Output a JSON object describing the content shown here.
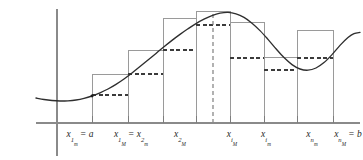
{
  "figure": {
    "axis": {
      "x_axis_name": "x-axis",
      "y_axis_name": "y-axis",
      "origin_x": 57,
      "baseline_y": 123
    },
    "labels": [
      {
        "id": "label-x1m",
        "x": 80,
        "text": "x1m = a",
        "var": "x",
        "sub": "1",
        "subsub": "m",
        "suffix": "= a"
      },
      {
        "id": "label-x1M",
        "x": 131,
        "text": "x1M = x2m",
        "var": "x",
        "sub": "1",
        "subsub": "M",
        "suffix": "= x2m"
      },
      {
        "id": "label-x2M",
        "x": 180,
        "text": "x2M",
        "var": "x",
        "sub": "2",
        "subsub": "M",
        "suffix": ""
      },
      {
        "id": "label-xiM",
        "x": 232,
        "text": "xiM",
        "var": "x",
        "sub": "i",
        "subsub": "M",
        "suffix": ""
      },
      {
        "id": "label-xim",
        "x": 266,
        "text": "xim",
        "var": "x",
        "sub": "i",
        "subsub": "m",
        "suffix": ""
      },
      {
        "id": "label-xnm",
        "x": 312,
        "text": "xnm",
        "var": "x",
        "sub": "n",
        "subsub": "m",
        "suffix": ""
      },
      {
        "id": "label-xnM",
        "x": 348,
        "text": "xnM = b",
        "var": "x",
        "sub": "n",
        "subsub": "M",
        "suffix": "= b"
      }
    ],
    "equals_sign": "=",
    "endpoint_a": "a",
    "endpoint_b": "b",
    "second_subscript_m": "m",
    "second_subscript_M": "M"
  },
  "chart_data": {
    "type": "area",
    "xlabel": "",
    "ylabel": "",
    "grid": false,
    "legend": "none",
    "xlim": [
      36,
      363
    ],
    "ylim": [
      0,
      123
    ],
    "axis_origin_px": {
      "x": 57,
      "y": 123
    },
    "tick_positions_px": [
      92,
      128,
      163,
      196,
      230,
      264,
      297,
      333
    ],
    "peak_dashed_line_px": 213,
    "partition_edges_px": [
      92,
      128,
      163,
      196,
      213,
      230,
      264,
      297,
      333
    ],
    "upper_sum_rectangles": [
      {
        "name": "rect-1",
        "x0": 92,
        "x1": 128,
        "top_y": 74
      },
      {
        "name": "rect-2",
        "x0": 128,
        "x1": 163,
        "top_y": 50
      },
      {
        "name": "rect-3",
        "x0": 163,
        "x1": 196,
        "top_y": 18
      },
      {
        "name": "rect-4",
        "x0": 196,
        "x1": 230,
        "top_y": 11
      },
      {
        "name": "rect-5",
        "x0": 230,
        "x1": 264,
        "top_y": 22
      },
      {
        "name": "rect-6",
        "x0": 264,
        "x1": 297,
        "top_y": 57
      },
      {
        "name": "rect-7",
        "x0": 297,
        "x1": 333,
        "top_y": 30
      }
    ],
    "lower_sum_levels": [
      {
        "name": "lower-1",
        "x0": 92,
        "x1": 128,
        "top_y": 95
      },
      {
        "name": "lower-2",
        "x0": 128,
        "x1": 163,
        "top_y": 74
      },
      {
        "name": "lower-3",
        "x0": 163,
        "x1": 196,
        "top_y": 50
      },
      {
        "name": "lower-4",
        "x0": 196,
        "x1": 230,
        "top_y": 25
      },
      {
        "name": "lower-5",
        "x0": 230,
        "x1": 264,
        "top_y": 58
      },
      {
        "name": "lower-6",
        "x0": 264,
        "x1": 297,
        "top_y": 70
      },
      {
        "name": "lower-7",
        "x0": 297,
        "x1": 333,
        "top_y": 58
      }
    ],
    "curve_points_px": [
      [
        36,
        98
      ],
      [
        44,
        99.5
      ],
      [
        52,
        100.5
      ],
      [
        60,
        101
      ],
      [
        68,
        100.8
      ],
      [
        76,
        100
      ],
      [
        84,
        98.4
      ],
      [
        92,
        96
      ],
      [
        100,
        92.8
      ],
      [
        108,
        89
      ],
      [
        116,
        84.4
      ],
      [
        124,
        79
      ],
      [
        132,
        73
      ],
      [
        140,
        66.6
      ],
      [
        148,
        60
      ],
      [
        156,
        53.4
      ],
      [
        164,
        46.8
      ],
      [
        172,
        40.4
      ],
      [
        180,
        34.4
      ],
      [
        188,
        28.8
      ],
      [
        196,
        23.6
      ],
      [
        204,
        19.2
      ],
      [
        212,
        15.6
      ],
      [
        220,
        13.2
      ],
      [
        228,
        12.4
      ],
      [
        236,
        13.8
      ],
      [
        244,
        17.4
      ],
      [
        252,
        23.2
      ],
      [
        260,
        30.6
      ],
      [
        268,
        39.4
      ],
      [
        276,
        48.8
      ],
      [
        284,
        57.6
      ],
      [
        292,
        64.6
      ],
      [
        300,
        69
      ],
      [
        308,
        70.2
      ],
      [
        316,
        68
      ],
      [
        324,
        62.6
      ],
      [
        332,
        54.6
      ],
      [
        340,
        45.4
      ],
      [
        348,
        37.6
      ],
      [
        354,
        33.6
      ],
      [
        360,
        32.4
      ]
    ]
  }
}
